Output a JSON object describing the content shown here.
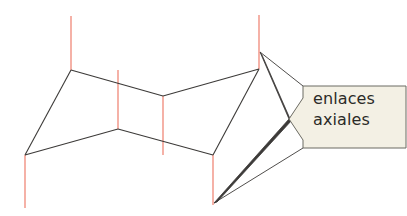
{
  "figure": {
    "background_color": "#ffffff",
    "width": 407,
    "height": 216,
    "skeleton": {
      "name": "cyclohexane-chair-ring",
      "stroke_color": "#3c3a38",
      "stroke_width": 1.1,
      "vertices": [
        {
          "id": "C1",
          "x": 71,
          "y": 70,
          "axial_direction": "up"
        },
        {
          "id": "C2",
          "x": 163,
          "y": 96,
          "axial_direction": "up"
        },
        {
          "id": "C3",
          "x": 259,
          "y": 69,
          "axial_direction": "up"
        },
        {
          "id": "C4",
          "x": 213,
          "y": 155,
          "axial_direction": "down"
        },
        {
          "id": "C5",
          "x": 118,
          "y": 129,
          "axial_direction": "down"
        },
        {
          "id": "C6",
          "x": 25,
          "y": 155,
          "axial_direction": "down"
        }
      ],
      "bonds": [
        {
          "from": "C1",
          "to": "C2"
        },
        {
          "from": "C2",
          "to": "C3"
        },
        {
          "from": "C3",
          "to": "C4"
        },
        {
          "from": "C4",
          "to": "C5"
        },
        {
          "from": "C5",
          "to": "C6"
        },
        {
          "from": "C6",
          "to": "C1"
        }
      ]
    },
    "axial_bonds": {
      "name": "axial-bonds",
      "stroke_color": "#f08878",
      "stroke_width": 1.3,
      "lines": [
        {
          "id": "ax-C1",
          "x": 71,
          "y1": 16,
          "y2": 70,
          "direction": "up"
        },
        {
          "id": "ax-C2",
          "x": 163,
          "y1": 96,
          "y2": 155,
          "direction": "down"
        },
        {
          "id": "ax-C3",
          "x": 259,
          "y1": 15,
          "y2": 69,
          "direction": "up"
        },
        {
          "id": "ax-C4",
          "x": 213,
          "y1": 155,
          "y2": 205,
          "direction": "down"
        },
        {
          "id": "ax-C5",
          "x": 118,
          "y1": 70,
          "y2": 129,
          "direction": "up"
        },
        {
          "id": "ax-C6",
          "x": 25,
          "y1": 155,
          "y2": 208,
          "direction": "down"
        }
      ]
    },
    "callout": {
      "name": "axial-bonds-callout",
      "label_line_1": "enlaces",
      "label_line_2": "axiales",
      "fill_color": "#f3f0e4",
      "stroke_color": "#6b6a62",
      "text_color": "#2b2b28",
      "polygon_points": "303,86 406,86 406,148 303,148 303,140 289,119 303,98",
      "pointer_tip": {
        "x": 289,
        "y": 119
      },
      "leader_lines": [
        {
          "id": "leader-to-top-axial",
          "x1": 289,
          "y1": 119,
          "x2": 260,
          "y2": 52
        },
        {
          "id": "leader-to-bottom-axial",
          "x1": 289,
          "y1": 119,
          "x2": 214,
          "y2": 203
        }
      ]
    }
  }
}
